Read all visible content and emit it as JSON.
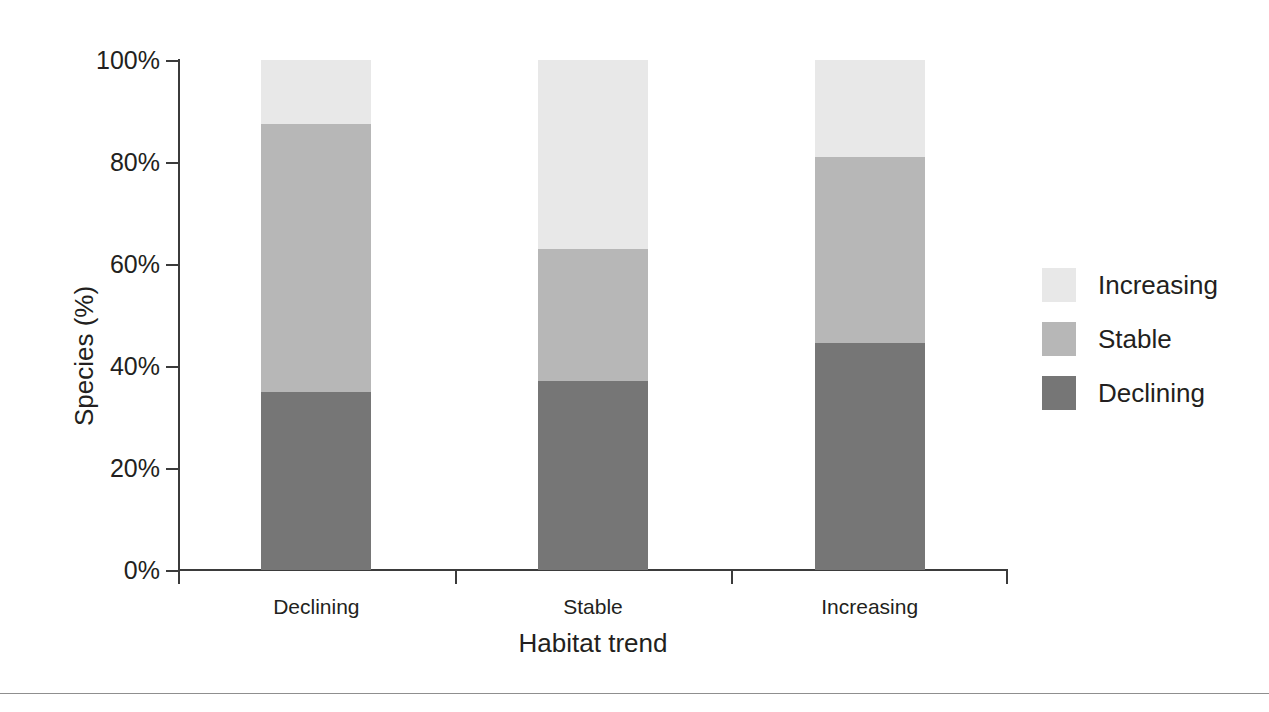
{
  "chart_data": {
    "type": "bar",
    "subtype": "stacked-100-percent",
    "title": "",
    "xlabel": "Habitat trend",
    "ylabel": "Species (%)",
    "categories": [
      "Declining",
      "Stable",
      "Increasing"
    ],
    "series": [
      {
        "name": "Declining",
        "color": "#767676",
        "values": [
          35.0,
          37.0,
          44.5
        ]
      },
      {
        "name": "Stable",
        "color": "#b7b7b7",
        "values": [
          52.5,
          26.0,
          36.5
        ]
      },
      {
        "name": "Increasing",
        "color": "#e8e8e8",
        "values": [
          12.5,
          37.0,
          19.0
        ]
      }
    ],
    "stack_order_bottom_to_top": [
      "Declining",
      "Stable",
      "Increasing"
    ],
    "cumulative_tops": {
      "Declining_bar": [
        35.0,
        87.5,
        100.0
      ],
      "Stable_bar": [
        37.0,
        63.0,
        100.0
      ],
      "Increasing_bar": [
        44.5,
        81.0,
        100.0
      ]
    },
    "ylim": [
      0,
      100
    ],
    "yticks": [
      0,
      20,
      40,
      60,
      80,
      100
    ],
    "ytick_labels": [
      "0%",
      "20%",
      "40%",
      "60%",
      "80%",
      "100%"
    ],
    "grid": false,
    "legend_position": "right",
    "legend_entries": [
      "Increasing",
      "Stable",
      "Declining"
    ]
  },
  "axes": {
    "y_title": "Species (%)",
    "x_title": "Habitat trend",
    "y_ticks": [
      {
        "label": "100%",
        "value": 100
      },
      {
        "label": "80%",
        "value": 80
      },
      {
        "label": "60%",
        "value": 60
      },
      {
        "label": "40%",
        "value": 40
      },
      {
        "label": "20%",
        "value": 20
      },
      {
        "label": "0%",
        "value": 0
      }
    ],
    "x_ticks": [
      {
        "label": "Declining"
      },
      {
        "label": "Stable"
      },
      {
        "label": "Increasing"
      }
    ]
  },
  "legend": {
    "items": [
      {
        "label": "Increasing",
        "color": "#e8e8e8"
      },
      {
        "label": "Stable",
        "color": "#b7b7b7"
      },
      {
        "label": "Declining",
        "color": "#767676"
      }
    ]
  },
  "colors": {
    "increasing": "#e8e8e8",
    "stable": "#b7b7b7",
    "declining": "#767676",
    "axis": "#3b3b3b",
    "text": "#231f20",
    "background": "#ffffff",
    "rule": "#8f8f8f"
  }
}
